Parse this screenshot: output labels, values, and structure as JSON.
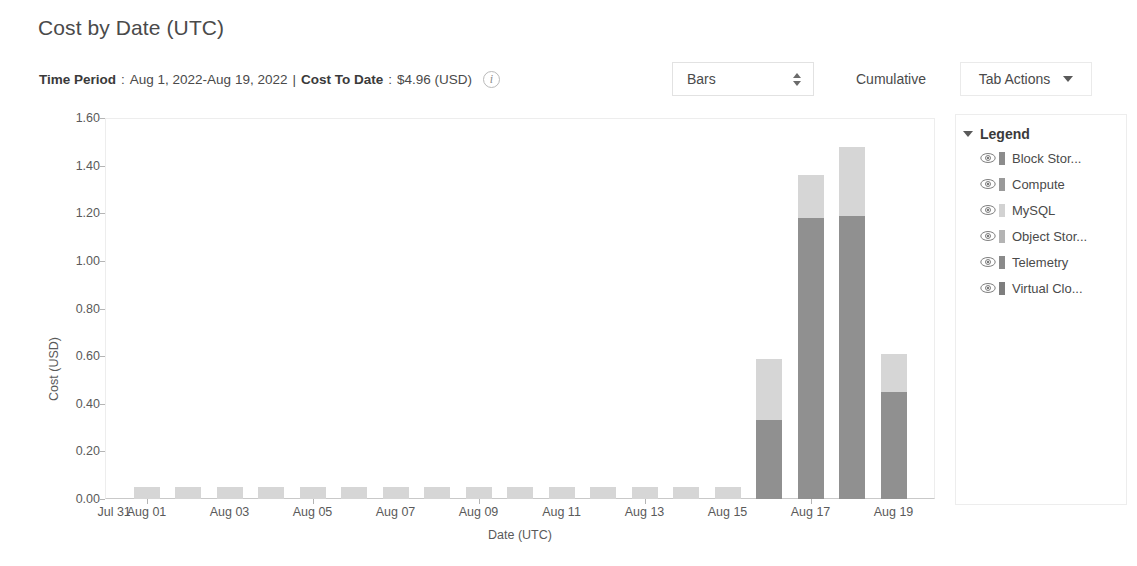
{
  "header": {
    "title": "Cost by Date (UTC)",
    "time_period_label": "Time Period",
    "time_period_value": "Aug 1, 2022-Aug 19, 2022",
    "separator": "|",
    "cost_to_date_label": "Cost To Date",
    "cost_to_date_value": "$4.96 (USD)",
    "colon": ":",
    "info_icon": "info-icon",
    "info_icon_glyph": "i"
  },
  "controls": {
    "chart_type_value": "Bars",
    "chart_type_icon": "spinner-updown-icon",
    "cumulative_label": "Cumulative",
    "tab_actions_label": "Tab Actions",
    "tab_actions_icon": "chevron-down-icon"
  },
  "legend": {
    "title": "Legend",
    "collapse_icon": "caret-down-icon",
    "items": [
      {
        "label": "Block Stor...",
        "color": "#8c8c8c",
        "visibility_icon": "eye-icon"
      },
      {
        "label": "Compute",
        "color": "#9a9a9a",
        "visibility_icon": "eye-icon"
      },
      {
        "label": "MySQL",
        "color": "#d2d2d2",
        "visibility_icon": "eye-icon"
      },
      {
        "label": "Object Stor...",
        "color": "#b4b4b4",
        "visibility_icon": "eye-icon"
      },
      {
        "label": "Telemetry",
        "color": "#8a8a8a",
        "visibility_icon": "eye-icon"
      },
      {
        "label": "Virtual Clo...",
        "color": "#7e7e7e",
        "visibility_icon": "eye-icon"
      }
    ]
  },
  "chart_data": {
    "type": "bar",
    "stacked": true,
    "title": "Cost by Date (UTC)",
    "xlabel": "Date (UTC)",
    "ylabel": "Cost (USD)",
    "ylim": [
      0.0,
      1.6
    ],
    "ytick_labels": [
      "0.00",
      "0.20",
      "0.40",
      "0.60",
      "0.80",
      "1.00",
      "1.20",
      "1.40",
      "1.60"
    ],
    "ytick_values": [
      0.0,
      0.2,
      0.4,
      0.6,
      0.8,
      1.0,
      1.2,
      1.4,
      1.6
    ],
    "grid": false,
    "legend_position": "right",
    "xtick_labels": [
      "Jul 31",
      "Aug 01",
      "Aug 03",
      "Aug 05",
      "Aug 07",
      "Aug 09",
      "Aug 11",
      "Aug 13",
      "Aug 15",
      "Aug 17",
      "Aug 19"
    ],
    "categories": [
      "Aug 01",
      "Aug 02",
      "Aug 03",
      "Aug 04",
      "Aug 05",
      "Aug 06",
      "Aug 07",
      "Aug 08",
      "Aug 09",
      "Aug 10",
      "Aug 11",
      "Aug 12",
      "Aug 13",
      "Aug 14",
      "Aug 15",
      "Aug 16",
      "Aug 17",
      "Aug 18",
      "Aug 19"
    ],
    "series": [
      {
        "name": "Lower",
        "color": "#909090",
        "values": [
          0.0,
          0.0,
          0.0,
          0.0,
          0.0,
          0.0,
          0.0,
          0.0,
          0.0,
          0.0,
          0.0,
          0.0,
          0.0,
          0.0,
          0.0,
          0.33,
          1.18,
          1.19,
          0.45
        ]
      },
      {
        "name": "Upper",
        "color": "#d6d6d6",
        "values": [
          0.05,
          0.05,
          0.05,
          0.05,
          0.05,
          0.05,
          0.05,
          0.05,
          0.05,
          0.05,
          0.05,
          0.05,
          0.05,
          0.05,
          0.05,
          0.26,
          0.18,
          0.29,
          0.16
        ]
      }
    ],
    "totals": [
      0.05,
      0.05,
      0.05,
      0.05,
      0.05,
      0.05,
      0.05,
      0.05,
      0.05,
      0.05,
      0.05,
      0.05,
      0.05,
      0.05,
      0.05,
      0.59,
      1.36,
      1.48,
      0.61
    ]
  }
}
